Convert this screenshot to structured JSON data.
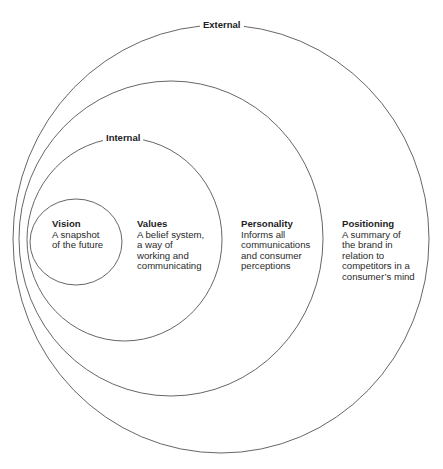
{
  "diagram": {
    "type": "nested-circles",
    "colors": {
      "stroke": "#555555",
      "text": "#2a2a2a",
      "background": "#ffffff"
    },
    "rings": [
      {
        "id": "external",
        "label": "External"
      },
      {
        "id": "middle",
        "label": ""
      },
      {
        "id": "internal",
        "label": "Internal"
      },
      {
        "id": "vision",
        "label": ""
      }
    ],
    "blocks": [
      {
        "title": "Vision",
        "lines": [
          "A snapshot",
          "of the future"
        ]
      },
      {
        "title": "Values",
        "lines": [
          "A belief system,",
          "a way of",
          "working and",
          "communicating"
        ]
      },
      {
        "title": "Personality",
        "lines": [
          "Informs all",
          "communications",
          "and consumer",
          "perceptions"
        ]
      },
      {
        "title": "Positioning",
        "lines": [
          "A summary of",
          "the brand in",
          "relation to",
          "competitors in a",
          "consumer’s mind"
        ]
      }
    ]
  }
}
